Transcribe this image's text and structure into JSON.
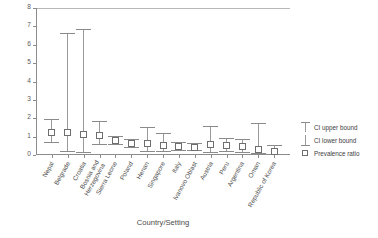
{
  "chart_data": {
    "type": "scatter",
    "title": "",
    "xlabel": "Country/Setting",
    "ylabel": "PR of any resistance",
    "ylim": [
      0,
      8
    ],
    "yticks": [
      0,
      1,
      2,
      3,
      4,
      5,
      6,
      7,
      8
    ],
    "grid": false,
    "legend_position": "right",
    "categories": [
      "Nepal",
      "Belgrade",
      "Croatia",
      "Bosnia and Herzegovina",
      "Sierra Leone",
      "Poland",
      "Henan",
      "Singapore",
      "Italy",
      "Ivanovo Oblast",
      "Austria",
      "Peru",
      "Argentina",
      "Oman",
      "Republic of Korea"
    ],
    "series": [
      {
        "name": "Prevalence ratio",
        "values": [
          1.25,
          1.2,
          1.1,
          1.05,
          0.78,
          0.62,
          0.6,
          0.5,
          0.45,
          0.42,
          0.55,
          0.5,
          0.45,
          0.32,
          0.2
        ]
      },
      {
        "name": "CI lower bound",
        "values": [
          0.72,
          0.2,
          0.18,
          0.62,
          0.6,
          0.46,
          0.2,
          0.2,
          0.26,
          0.26,
          0.18,
          0.2,
          0.18,
          0.1,
          0.05
        ]
      },
      {
        "name": "CI upper bound",
        "values": [
          1.95,
          6.65,
          6.85,
          1.85,
          1.02,
          0.85,
          1.5,
          1.18,
          0.72,
          0.66,
          1.6,
          0.92,
          0.88,
          1.72,
          0.55
        ]
      }
    ],
    "legend": [
      {
        "id": "ci-upper",
        "label": "CI upper bound"
      },
      {
        "id": "ci-lower",
        "label": "CI lower bound"
      },
      {
        "id": "prevalence-ratio",
        "label": "Prevalence ratio"
      }
    ],
    "colors": {
      "axis": "#8c8c8c",
      "whisker": "#9a9a9a",
      "marker_border": "#6e6e6e",
      "marker_fill": "#ffffff",
      "text": "#4a4a4a"
    }
  }
}
